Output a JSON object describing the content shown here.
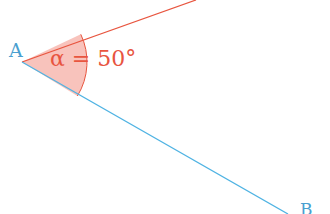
{
  "diagram": {
    "type": "angle",
    "vertex": {
      "label": "A",
      "x": 22,
      "y": 62
    },
    "ray_upper": {
      "color": "#e8553f",
      "to": [
        196,
        0
      ]
    },
    "ray_lower": {
      "color": "#4fb3e3",
      "to": [
        288,
        214
      ],
      "end_label": "B"
    },
    "angle": {
      "symbol": "α",
      "equals": "=",
      "value": "50°",
      "text": "α = 50°",
      "fill": "#f7b8b0",
      "stroke": "#e8553f",
      "radius": 65
    },
    "colors": {
      "label_blue": "#4a9fd0",
      "label_red": "#e8553f",
      "background": "#ffffff"
    }
  }
}
